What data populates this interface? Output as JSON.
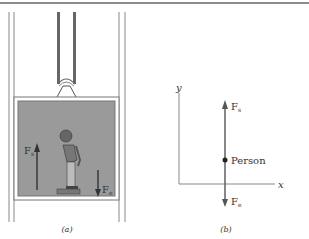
{
  "figure_a": {
    "caption": "(a)",
    "force_up_label": "F",
    "force_up_sub": "s",
    "force_down_label": "F",
    "force_down_sub": "e",
    "colors": {
      "cabin_fill": "#9a9a9a",
      "frame": "#777777",
      "arrow": "#333333"
    }
  },
  "figure_b": {
    "caption": "(b)",
    "y_axis_label": "y",
    "x_axis_label": "x",
    "point_label": "Person",
    "force_up_label": "F",
    "force_up_sub": "s",
    "force_down_label": "F",
    "force_down_sub": "e"
  }
}
